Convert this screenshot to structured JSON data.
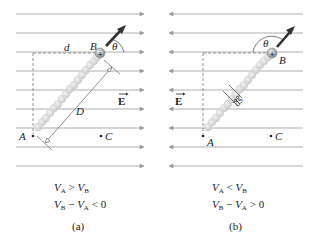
{
  "figure": {
    "panels": [
      {
        "id": "a",
        "caption": "(a)",
        "field_direction": "right",
        "labels": {
          "B": "B",
          "A": "A",
          "C": "C",
          "d": "d",
          "D": "D",
          "theta": "θ",
          "E": "E"
        },
        "equations": [
          {
            "lhs_v": "V",
            "lhs_sub": "A",
            "op": " > ",
            "rhs_v": "V",
            "rhs_sub": "B",
            "tail": ""
          },
          {
            "lhs_v": "V",
            "lhs_sub": "B",
            "op": " − ",
            "rhs_v": "V",
            "rhs_sub": "A",
            "tail": " < 0"
          }
        ]
      },
      {
        "id": "b",
        "caption": "(b)",
        "field_direction": "left",
        "labels": {
          "B": "B",
          "A": "A",
          "C": "C",
          "ds": "ds",
          "theta": "θ",
          "E": "E"
        },
        "equations": [
          {
            "lhs_v": "V",
            "lhs_sub": "A",
            "op": " < ",
            "rhs_v": "V",
            "rhs_sub": "B",
            "tail": ""
          },
          {
            "lhs_v": "V",
            "lhs_sub": "B",
            "op": " − ",
            "rhs_v": "V",
            "rhs_sub": "A",
            "tail": " > 0"
          }
        ]
      }
    ],
    "charge_symbol": "+",
    "colors": {
      "field_line": "#999999",
      "arrow": "#333333",
      "path_beads": "#c8c8c8",
      "charge": "#9a9a9a"
    }
  }
}
